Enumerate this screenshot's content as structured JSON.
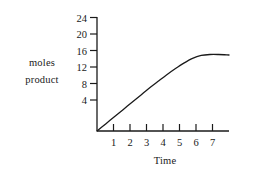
{
  "chart_data": {
    "type": "line",
    "title": "",
    "subtitle": "",
    "xlabel": "Time",
    "ylabel": "moles product",
    "ylabel_lines": [
      "moles",
      "product"
    ],
    "x": [
      0,
      0.5,
      1,
      1.5,
      2,
      2.5,
      3,
      3.5,
      4,
      4.5,
      5,
      5.5,
      6,
      6.5,
      7,
      7.6
    ],
    "values": [
      0,
      1.5,
      3.0,
      4.5,
      6.0,
      7.5,
      9.0,
      10.4,
      11.8,
      13.1,
      14.3,
      15.3,
      15.9,
      16.1,
      16.1,
      16.0
    ],
    "series": [
      {
        "name": "moles product",
        "values": [
          0,
          1.5,
          3.0,
          4.5,
          6.0,
          7.5,
          9.0,
          10.4,
          11.8,
          13.1,
          14.3,
          15.3,
          15.9,
          16.1,
          16.1,
          16.0
        ]
      }
    ],
    "xticks": [
      1,
      2,
      3,
      4,
      5,
      6,
      7
    ],
    "xtick_labels": [
      "1",
      "2",
      "3",
      "4",
      "5",
      "6",
      "7"
    ],
    "yticks": [
      4,
      8,
      12,
      16,
      20,
      24
    ],
    "ytick_labels": [
      "4",
      "8",
      "12",
      "16",
      "20",
      "24"
    ],
    "xlim": [
      0,
      7.6
    ],
    "ylim": [
      0,
      24
    ],
    "grid": false,
    "legend": false,
    "legend_position": "none",
    "plateau_value": 16,
    "line_color": "#1a1a1a",
    "axis_color": "#1a1a1a",
    "background_color": "#ffffff"
  }
}
